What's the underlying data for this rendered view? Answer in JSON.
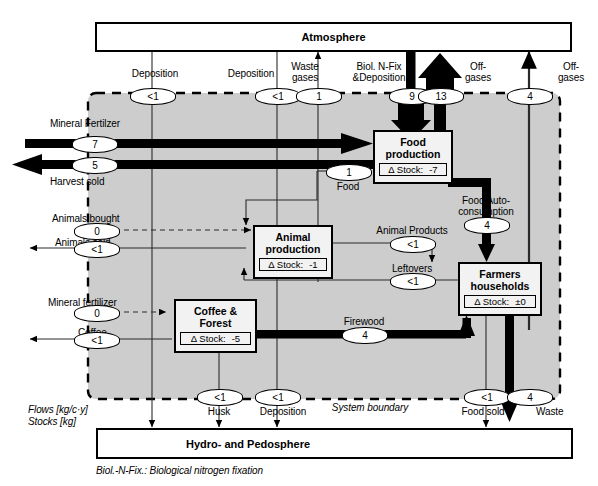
{
  "diagram": {
    "reservoirs": [
      {
        "id": "atmosphere",
        "label": "Atmosphere"
      },
      {
        "id": "hydro_pedosphere",
        "label": "Hydro- and Pedosphere"
      }
    ],
    "processes": [
      {
        "id": "food_production",
        "title_line1": "Food",
        "title_line2": "production",
        "stock_label": "Δ Stock:",
        "stock_value": "-7"
      },
      {
        "id": "animal_production",
        "title_line1": "Animal",
        "title_line2": "production",
        "stock_label": "Δ Stock:",
        "stock_value": "-1"
      },
      {
        "id": "farmers_households",
        "title_line1": "Farmers",
        "title_line2": "households",
        "stock_label": "Δ Stock:",
        "stock_value": "±0"
      },
      {
        "id": "coffee_forest",
        "title_line1": "Coffee &",
        "title_line2": "Forest",
        "stock_label": "Δ Stock:",
        "stock_value": "-5"
      }
    ],
    "boundary_label": "System boundary",
    "units": {
      "flows": "Flows [kg/c·y]",
      "stocks": "Stocks [kg]"
    },
    "footnote": "Biol.-N-Fix.: Biological nitrogen fixation",
    "flows": [
      {
        "id": "deposition_coffee",
        "name": "Deposition",
        "value": "<1"
      },
      {
        "id": "deposition_animal",
        "name": "Deposition",
        "value": "<1"
      },
      {
        "id": "waste_gases",
        "name": "Waste gases",
        "value": "1"
      },
      {
        "id": "biol_nfix_deposition",
        "name": "Biol. N-Fix &Deposition",
        "value": "9"
      },
      {
        "id": "offgases_food",
        "name": "Off-gases",
        "value": "13"
      },
      {
        "id": "offgases_waste",
        "name": "Off-gases",
        "value": "4"
      },
      {
        "id": "mineral_fertilizer_food",
        "name": "Mineral Fertilzer",
        "value": "7"
      },
      {
        "id": "harvest_sold",
        "name": "Harvest sold",
        "value": "5"
      },
      {
        "id": "food",
        "name": "Food",
        "value": "1"
      },
      {
        "id": "food_autoconsumption",
        "name": "Food Auto-consumption",
        "value": "4"
      },
      {
        "id": "animals_bought",
        "name": "Animals bought",
        "value": "0"
      },
      {
        "id": "animals_sold",
        "name": "Animals sold",
        "value": "<1"
      },
      {
        "id": "animal_products",
        "name": "Animal Products",
        "value": "<1"
      },
      {
        "id": "leftovers",
        "name": "Leftovers",
        "value": "<1"
      },
      {
        "id": "mineral_fertilizer_coffee",
        "name": "Mineral fertilizer",
        "value": "0"
      },
      {
        "id": "coffee",
        "name": "Coffee",
        "value": "<1"
      },
      {
        "id": "firewood",
        "name": "Firewood",
        "value": "4"
      },
      {
        "id": "husk",
        "name": "Husk",
        "value": "<1"
      },
      {
        "id": "deposition_bottom",
        "name": "Deposition",
        "value": "<1"
      },
      {
        "id": "food_sold",
        "name": "Food sold",
        "value": "<1"
      },
      {
        "id": "waste",
        "name": "Waste",
        "value": "4"
      }
    ],
    "colors": {
      "boundary_fill": "#cdcdcd",
      "stroke": "#000000",
      "box_fill": "#f2f2f2",
      "reservoir_fill": "#ffffff"
    }
  }
}
